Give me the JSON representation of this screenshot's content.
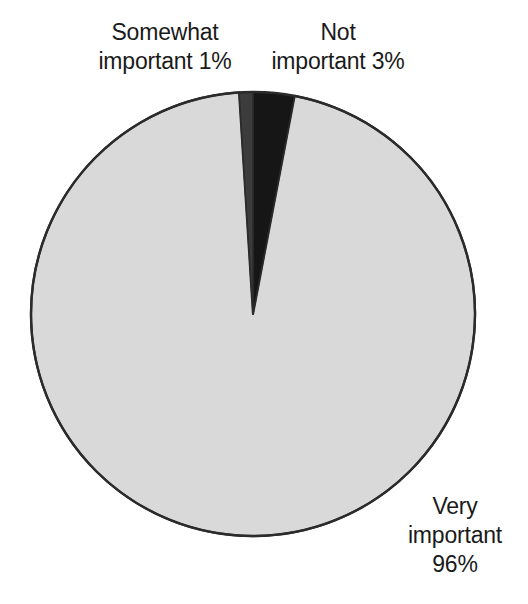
{
  "chart_data": {
    "type": "pie",
    "title": "",
    "categories": [
      "Very important",
      "Not important",
      "Somewhat important"
    ],
    "values": [
      96,
      3,
      1
    ],
    "value_unit": "%",
    "labels": [
      {
        "name": "very-important",
        "line1": "Very",
        "line2": "important",
        "line3": "96%",
        "value": 96,
        "color": "#d9d9d9"
      },
      {
        "name": "not-important",
        "line1": "Not",
        "line2": "important 3%",
        "value": 3,
        "color": "#161616"
      },
      {
        "name": "somewhat-important",
        "line1": "Somewhat",
        "line2": "important 1%",
        "value": 1,
        "color": "#3c3c3c"
      }
    ],
    "legend": "none",
    "grid": false,
    "start_angle_deg": -90,
    "direction": "clockwise",
    "geometry": {
      "cx": 253,
      "cy": 314,
      "r": 222
    },
    "colors": {
      "very_important": "#d9d9d9",
      "not_important": "#161616",
      "somewhat_important": "#3c3c3c",
      "outline": "#2b2b2b",
      "text": "#1a1a1a",
      "background": "#ffffff"
    }
  },
  "labels": {
    "somewhat": {
      "line1": "Somewhat",
      "line2": "important 1%"
    },
    "not": {
      "line1": "Not",
      "line2": "important 3%"
    },
    "very": {
      "line1": "Very",
      "line2": "important",
      "line3": "96%"
    }
  }
}
